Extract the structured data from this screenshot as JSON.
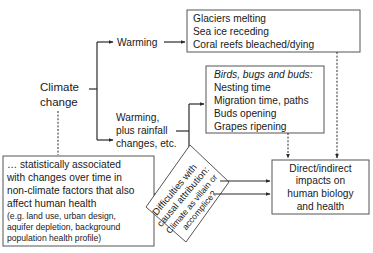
{
  "diagram": {
    "root": {
      "line1": "Climate",
      "line2": "change"
    },
    "branch_warming": {
      "label": "Warming"
    },
    "branch_warming_rain": {
      "line1": "Warming,",
      "line2": "plus rainfall",
      "line3": "changes, etc."
    },
    "box_physical": {
      "items": [
        "Glaciers melting",
        "Sea ice receding",
        "Coral reefs bleached/dying"
      ]
    },
    "box_biological": {
      "title": "Birds, bugs and buds:",
      "items": [
        "Nesting time",
        "Migration time, paths",
        "Buds opening",
        "Grapes ripening"
      ]
    },
    "box_nonclimate": {
      "lines": [
        "… statistically associated",
        "with changes over time in",
        "non-climate factors that also",
        "affect human health"
      ],
      "sublines": [
        "(e.g. land use, urban design,",
        "aquifer depletion, background",
        "population health profile)"
      ]
    },
    "diamond": {
      "lines": [
        "Difficulties with",
        "causal attribution:",
        "Climate as villain or",
        "accomplice?"
      ]
    },
    "box_impacts": {
      "lines": [
        "Direct/indirect",
        "impacts on",
        "human biology",
        "and health"
      ]
    },
    "colors": {
      "line": "#2a2a2a",
      "box_border": "#555555",
      "text": "#1a1a1a",
      "background": "#ffffff"
    }
  }
}
